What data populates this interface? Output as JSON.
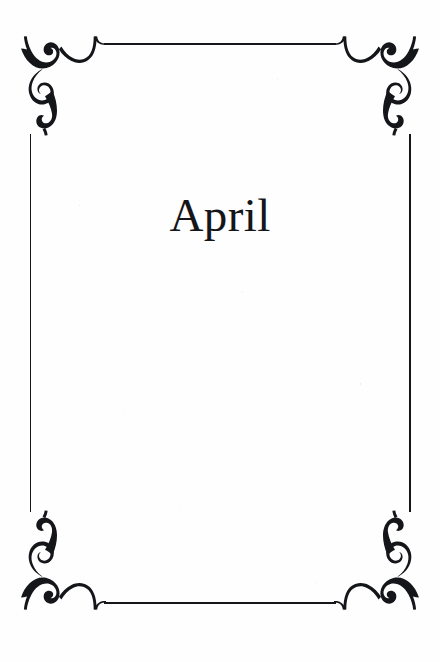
{
  "page": {
    "kind": "decorative-section-divider",
    "title": "April",
    "background_color": "#fefefe",
    "ink_color": "#15161a"
  },
  "frame": {
    "name": "ornamental-border",
    "corner_count": 4,
    "corners": [
      {
        "position": "top-left",
        "mirror": "none"
      },
      {
        "position": "top-right",
        "mirror": "horizontal"
      },
      {
        "position": "bottom-left",
        "mirror": "vertical"
      },
      {
        "position": "bottom-right",
        "mirror": "both"
      }
    ]
  }
}
